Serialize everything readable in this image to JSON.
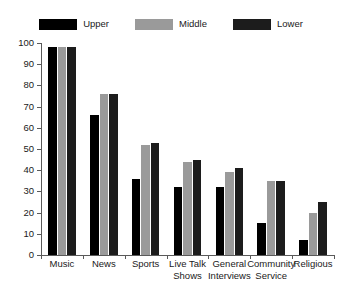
{
  "chart_data": {
    "type": "bar",
    "title": "",
    "subtitle": "",
    "xlabel": "",
    "ylabel": "",
    "ylim": [
      0,
      100
    ],
    "yticks": [
      0,
      10,
      20,
      30,
      40,
      50,
      60,
      70,
      80,
      90,
      100
    ],
    "grid": false,
    "legend_position": "top-center",
    "categories": [
      "Music",
      "News",
      "Sports",
      "Live Talk\nShows",
      "General\nInterviews",
      "Community\nService",
      "Religious"
    ],
    "series": [
      {
        "name": "Upper",
        "color": "#000000",
        "values": [
          98,
          66,
          36,
          32,
          32,
          15,
          7
        ]
      },
      {
        "name": "Middle",
        "color": "#9a9a9a",
        "values": [
          98,
          76,
          52,
          44,
          39,
          35,
          20
        ]
      },
      {
        "name": "Lower",
        "color": "#1c1c1c",
        "values": [
          98,
          76,
          53,
          45,
          41,
          35,
          25
        ]
      }
    ]
  },
  "axis": {
    "tick_labels": [
      "100",
      "90",
      "80",
      "70",
      "60",
      "50",
      "40",
      "30",
      "20",
      "10",
      "0"
    ],
    "axis_color": "#5a5a5a"
  },
  "legend": {
    "items": [
      {
        "label": "Upper",
        "color": "#000000"
      },
      {
        "label": "Middle",
        "color": "#9a9a9a"
      },
      {
        "label": "Lower",
        "color": "#1c1c1c"
      }
    ]
  }
}
